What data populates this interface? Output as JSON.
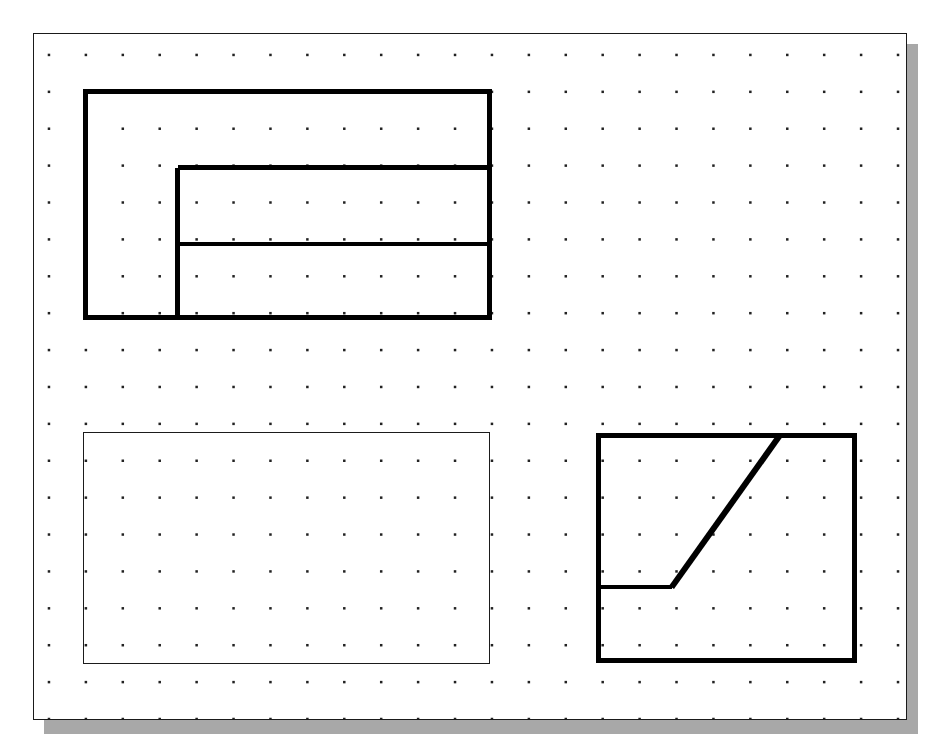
{
  "app": {
    "title": "Drawing Canvas",
    "background_color": "#ffffff"
  },
  "canvas": {
    "name": "drawing-sheet",
    "x": 33,
    "y": 33,
    "width": 874,
    "height": 687,
    "fill_color": "#ffffff",
    "border_color": "#1a1a1a",
    "border_width": 1,
    "shadow": {
      "color": "#a8a8a8",
      "offset_x": 11,
      "offset_y": 11
    }
  },
  "grid": {
    "name": "dot-grid",
    "visible": true,
    "dot_color": "#222222",
    "dot_size": 2.5,
    "spacing_x": 37,
    "spacing_y": 37,
    "origin_x": 15,
    "origin_y": 21,
    "columns": 24,
    "rows": 19
  },
  "shapes": [
    {
      "id": "shape-1",
      "name": "notched-rectangle",
      "type": "polyline-group",
      "stroke_color": "#000000",
      "stroke_width": 5,
      "outline": {
        "x": 49,
        "y": 55,
        "width": 410,
        "height": 232
      },
      "interior_lines": [
        {
          "name": "vertical-divider",
          "x1": 144,
          "y1": 134,
          "x2": 144,
          "y2": 287,
          "stroke_width": 5
        },
        {
          "name": "upper-horizontal-divider",
          "x1": 144,
          "y1": 134,
          "x2": 459,
          "y2": 134,
          "stroke_width": 5
        },
        {
          "name": "lower-horizontal-divider",
          "x1": 144,
          "y1": 211,
          "x2": 459,
          "y2": 211,
          "stroke_width": 4
        }
      ]
    },
    {
      "id": "shape-2",
      "name": "plain-rectangle",
      "type": "rectangle",
      "stroke_color": "#1a1a1a",
      "stroke_width": 1,
      "x": 49,
      "y": 399,
      "width": 408,
      "height": 233
    },
    {
      "id": "shape-3",
      "name": "ramped-rectangle",
      "type": "polyline-group",
      "stroke_color": "#000000",
      "stroke_width": 5,
      "outline": {
        "x": 563,
        "y": 400,
        "width": 262,
        "height": 231
      },
      "interior_lines": [
        {
          "name": "horizontal-ledge",
          "x1": 563,
          "y1": 555,
          "x2": 639,
          "y2": 555,
          "stroke_width": 4
        },
        {
          "name": "diagonal-ramp",
          "x1": 639,
          "y1": 555,
          "x2": 748,
          "y2": 402,
          "stroke_width": 6
        }
      ]
    }
  ]
}
